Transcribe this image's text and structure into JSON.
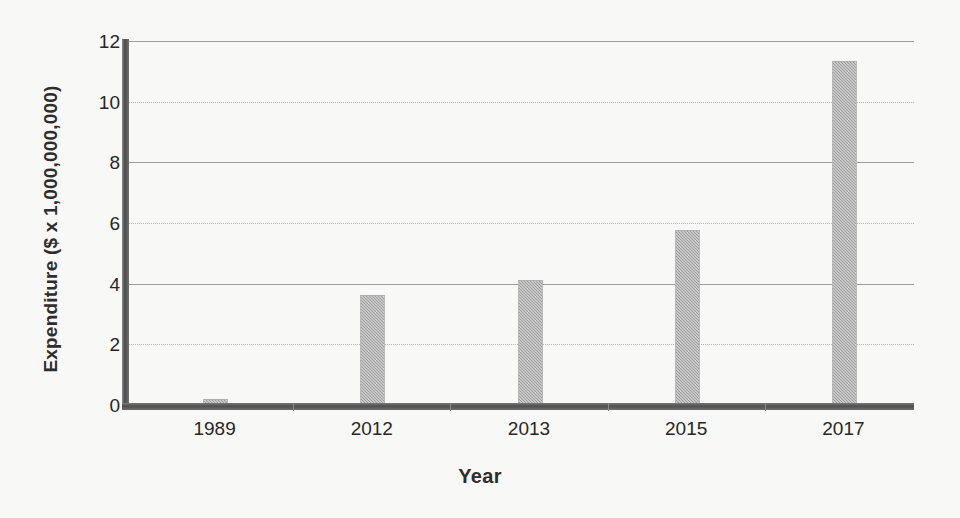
{
  "chart_data": {
    "type": "bar",
    "title": "",
    "xlabel": "Year",
    "ylabel": "Expenditure ($ x 1,000,000,000)",
    "categories": [
      "1989",
      "2012",
      "2013",
      "2015",
      "2017"
    ],
    "values": [
      0.15,
      3.6,
      4.1,
      5.75,
      11.3
    ],
    "series": [
      {
        "name": "Expenditure",
        "values": [
          0.15,
          3.6,
          4.1,
          5.75,
          11.3
        ]
      }
    ],
    "ylim": [
      0,
      12
    ],
    "xlim_note": "categorical",
    "yticks": [
      0,
      2,
      4,
      6,
      8,
      10,
      12
    ],
    "ytick_labels": [
      "0",
      "2",
      "4",
      "6",
      "8",
      "10",
      "12"
    ],
    "gridlines": {
      "enabled": true,
      "axis": "y",
      "styles": [
        "solid",
        "dotted",
        "solid",
        "dotted",
        "solid",
        "dotted",
        "solid"
      ]
    },
    "legend": {
      "visible": false,
      "position": "none"
    },
    "bar_color": "#9f9f9f",
    "axis_color": "#4f4f4f",
    "background_color": "#f8f8f6",
    "text_color": "#272727"
  },
  "axes": {
    "y_title": "Expenditure ($ x 1,000,000,000)",
    "x_title": "Year",
    "y_ticks": [
      {
        "label": "12",
        "value": 12
      },
      {
        "label": "10",
        "value": 10
      },
      {
        "label": "8",
        "value": 8
      },
      {
        "label": "6",
        "value": 6
      },
      {
        "label": "4",
        "value": 4
      },
      {
        "label": "2",
        "value": 2
      },
      {
        "label": "0",
        "value": 0
      }
    ],
    "x_ticks": [
      {
        "label": "1989"
      },
      {
        "label": "2012"
      },
      {
        "label": "2013"
      },
      {
        "label": "2015"
      },
      {
        "label": "2017"
      }
    ]
  }
}
